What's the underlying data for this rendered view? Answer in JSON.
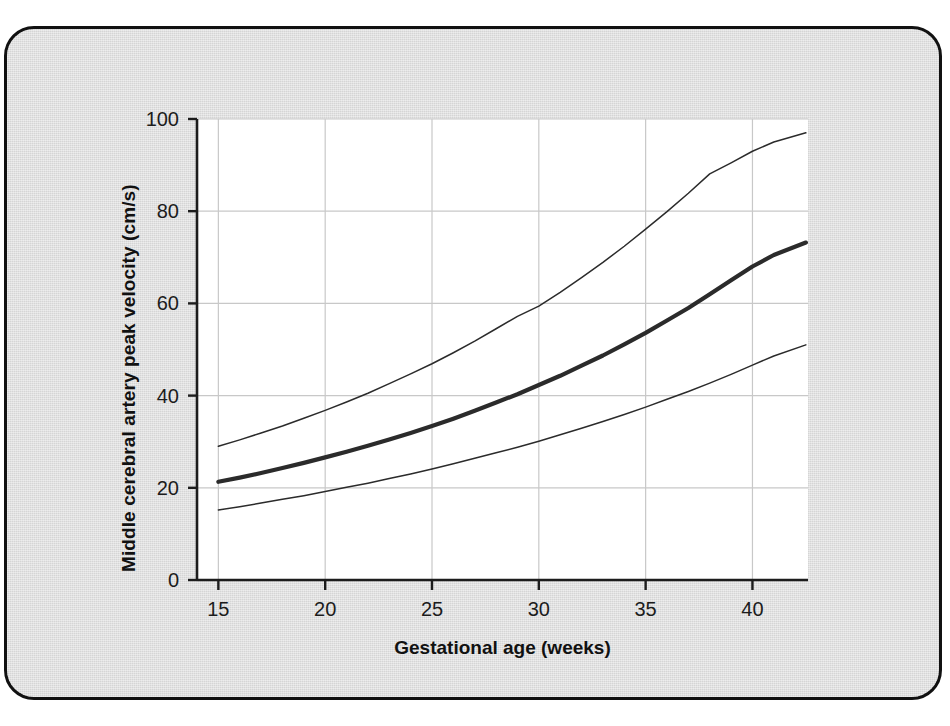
{
  "figure": {
    "background_color": "#dcdcdc",
    "plot_background_color": "#ffffff",
    "border_color": "#111111",
    "grid_color": "#c8c8c8",
    "axis_color": "#1c1c1c",
    "curve_color": "#2b2b2b"
  },
  "chart_data": {
    "type": "line",
    "title": "",
    "xlabel": "Gestational age (weeks)",
    "ylabel": "Middle cerebral artery peak velocity (cm/s)",
    "xlim": [
      14.0,
      42.6
    ],
    "ylim": [
      0,
      100
    ],
    "xticks": [
      15,
      20,
      25,
      30,
      35,
      40
    ],
    "xtick_labels": [
      "15",
      "20",
      "25",
      "30",
      "35",
      "40"
    ],
    "yticks": [
      0,
      20,
      40,
      60,
      80,
      100
    ],
    "ytick_labels": [
      "0",
      "20",
      "40",
      "60",
      "80",
      "100"
    ],
    "grid": "both",
    "legend": "none",
    "x": [
      15,
      16,
      17,
      18,
      19,
      20,
      21,
      22,
      23,
      24,
      25,
      26,
      27,
      28,
      29,
      30,
      31,
      32,
      33,
      34,
      35,
      36,
      37,
      38,
      39,
      40,
      41,
      42.5
    ],
    "series": [
      {
        "name": "Upper reference limit (95th centile)",
        "style": "thin",
        "values": [
          29.0,
          30.4,
          31.9,
          33.4,
          35.1,
          36.8,
          38.6,
          40.5,
          42.6,
          44.7,
          46.9,
          49.3,
          51.8,
          54.5,
          57.2,
          59.4,
          62.4,
          65.6,
          68.9,
          72.4,
          76.1,
          79.9,
          83.9,
          88.1,
          90.5,
          93.0,
          95.0,
          97.0
        ]
      },
      {
        "name": "Median (50th centile)",
        "style": "thick",
        "values": [
          21.3,
          22.2,
          23.2,
          24.3,
          25.4,
          26.6,
          27.8,
          29.1,
          30.5,
          31.9,
          33.4,
          35.0,
          36.7,
          38.5,
          40.3,
          42.3,
          44.3,
          46.5,
          48.7,
          51.1,
          53.6,
          56.3,
          59.0,
          62.0,
          65.0,
          68.0,
          70.5,
          73.2
        ]
      },
      {
        "name": "Lower reference limit (5th centile)",
        "style": "thin",
        "values": [
          15.2,
          15.9,
          16.7,
          17.5,
          18.3,
          19.2,
          20.1,
          21.0,
          22.0,
          23.0,
          24.1,
          25.2,
          26.4,
          27.6,
          28.8,
          30.1,
          31.5,
          32.9,
          34.4,
          35.9,
          37.5,
          39.2,
          40.9,
          42.7,
          44.6,
          46.6,
          48.6,
          51.0
        ]
      }
    ]
  }
}
